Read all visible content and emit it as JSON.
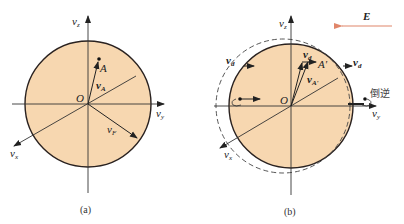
{
  "colors": {
    "disk_fill": "#f7d7b0",
    "disk_stroke": "#2a2220",
    "axis": "#333333",
    "field_arrow": "#e0866a",
    "text": "#222222"
  },
  "figure_a": {
    "caption": "(a)",
    "axis_z": "v",
    "axis_z_sub": "z",
    "axis_y": "v",
    "axis_y_sub": "y",
    "axis_x": "v",
    "axis_x_sub": "x",
    "origin": "O",
    "point": "A",
    "vec_A": "v",
    "vec_A_sub": "A",
    "vec_F": "v",
    "vec_F_sub": "F"
  },
  "figure_b": {
    "caption": "(b)",
    "field_label": "E",
    "axis_z": "v",
    "axis_z_sub": "z",
    "axis_y": "v",
    "axis_y_sub": "y",
    "axis_x": "v",
    "axis_x_sub": "x",
    "origin": "O",
    "point": "A'",
    "vec_d_top": "v",
    "vec_d_top_sub": "d",
    "vec_d_left": "v",
    "vec_d_left_sub": "d",
    "vec_d_right": "v",
    "vec_d_right_sub": "d",
    "vec_A_prime": "v",
    "vec_A_prime_sub": "A'",
    "reverse_label": "倒逆"
  }
}
